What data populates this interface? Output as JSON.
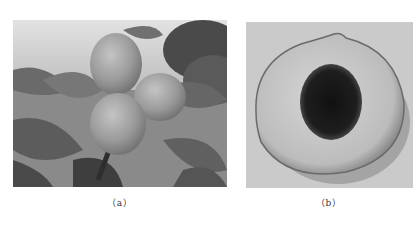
{
  "figure": {
    "panels": [
      {
        "id": "a",
        "caption": "（a）",
        "description": "Three peach fruits hanging on a branch among leaves, grayscale photo"
      },
      {
        "id": "b",
        "caption": "（b）",
        "description": "Halved peach showing flesh and dark pit cavity, grayscale photo"
      }
    ]
  },
  "colors": {
    "background": "#ffffff",
    "caption_text": "#333333"
  }
}
